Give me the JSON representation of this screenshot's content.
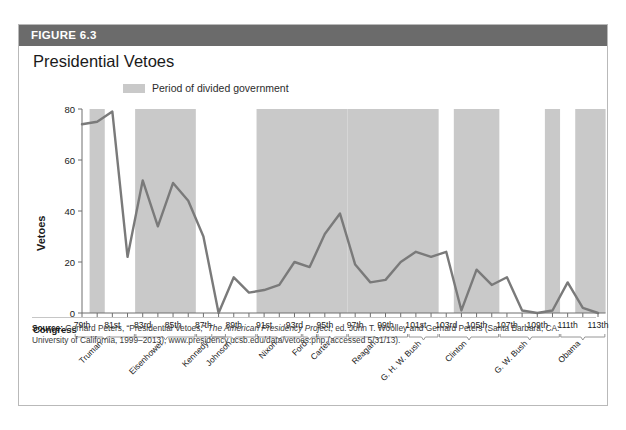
{
  "figure": {
    "number_label": "FIGURE 6.3",
    "title": "Presidential Vetoes",
    "legend_label": "Period of divided government",
    "congress_axis_word": "Congress",
    "source_prefix": "Source:",
    "source_part1": " Gerhard Peters, “Presidential Vetoes,” ",
    "source_italic": "The American Presidency Project",
    "source_part2": ", ed. John T. Woolley and Gerhard Peters (Santa Barbara, CA: University of California, 1999–2013), www.presidency.ucsb.edu/data/vetoes.php (accessed 5/31/13)."
  },
  "colors": {
    "header_bar": "#6b6b6b",
    "shade_band": "#c9c9c9",
    "line": "#7a7a7a",
    "axis": "#6e6e6e",
    "text": "#1a1a1a"
  },
  "chart_data": {
    "type": "line",
    "title": "Presidential Vetoes",
    "xlabel": "Congress",
    "ylabel": "Vetoes",
    "ylim": [
      0,
      80
    ],
    "yticks": [
      0,
      20,
      40,
      60,
      80
    ],
    "ytick_labels": [
      "0",
      "20",
      "40",
      "60",
      "80"
    ],
    "grid": false,
    "legend_position": "top-left",
    "categories": [
      "79th",
      "80th",
      "81st",
      "82nd",
      "83rd",
      "84th",
      "85th",
      "86th",
      "87th",
      "88th",
      "89th",
      "90th",
      "91st",
      "92nd",
      "93rd",
      "94th",
      "95th",
      "96th",
      "97th",
      "98th",
      "99th",
      "100th",
      "101st",
      "102nd",
      "103rd",
      "104th",
      "105th",
      "106th",
      "107th",
      "108th",
      "109th",
      "110th",
      "111th",
      "112th",
      "113th"
    ],
    "xtick_labels_shown": [
      "79th",
      "81st",
      "83rd",
      "85th",
      "87th",
      "89th",
      "91st",
      "93rd",
      "95th",
      "97th",
      "99th",
      "101st",
      "103rd",
      "105th",
      "107th",
      "109th",
      "111th",
      "113th"
    ],
    "series": [
      {
        "name": "Vetoes",
        "values": [
          74,
          75,
          79,
          22,
          52,
          34,
          51,
          44,
          30,
          0,
          14,
          8,
          9,
          11,
          20,
          18,
          31,
          39,
          19,
          12,
          13,
          20,
          24,
          22,
          24,
          1,
          17,
          11,
          14,
          1,
          0,
          1,
          12,
          2,
          0
        ]
      }
    ],
    "shaded_periods": [
      {
        "label": "Period of divided government",
        "start": "80th",
        "end": "80th"
      },
      {
        "label": "Period of divided government",
        "start": "83rd",
        "end": "86th"
      },
      {
        "label": "Period of divided government",
        "start": "91st",
        "end": "96th"
      },
      {
        "label": "Period of divided government",
        "start": "97th",
        "end": "102nd"
      },
      {
        "label": "Period of divided government",
        "start": "104th",
        "end": "106th"
      },
      {
        "label": "Period of divided government",
        "start": "110th",
        "end": "110th"
      },
      {
        "label": "Period of divided government",
        "start": "112th",
        "end": "113th"
      }
    ],
    "presidents": [
      {
        "name": "Truman",
        "start": "79th",
        "end": "82nd"
      },
      {
        "name": "Eisenhower",
        "start": "83rd",
        "end": "86th"
      },
      {
        "name": "Kennedy",
        "start": "87th",
        "end": "88th"
      },
      {
        "name": "Johnson",
        "start": "88th",
        "end": "90th"
      },
      {
        "name": "Nixon",
        "start": "91st",
        "end": "93rd"
      },
      {
        "name": "Ford",
        "start": "94th",
        "end": "94th"
      },
      {
        "name": "Carter",
        "start": "95th",
        "end": "96th"
      },
      {
        "name": "Reagan",
        "start": "97th",
        "end": "100th"
      },
      {
        "name": "G. H. W. Bush",
        "start": "101st",
        "end": "102nd"
      },
      {
        "name": "Clinton",
        "start": "103rd",
        "end": "106th"
      },
      {
        "name": "G. W. Bush",
        "start": "107th",
        "end": "110th"
      },
      {
        "name": "Obama",
        "start": "111th",
        "end": "113th"
      }
    ]
  }
}
